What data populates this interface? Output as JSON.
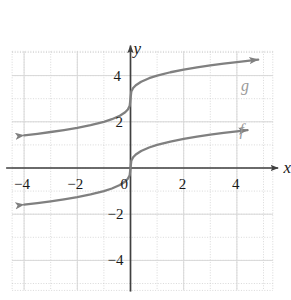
{
  "chart_data": {
    "type": "line",
    "title": "",
    "xlabel": "x",
    "ylabel": "y",
    "xlim": [
      -5.1,
      5.5
    ],
    "ylim": [
      -5.4,
      5.3
    ],
    "grid": true,
    "grid_major_step": 2,
    "grid_minor_step": 1,
    "legend_position": "inline-right",
    "x_ticks": [
      {
        "value": -4,
        "label": "−4"
      },
      {
        "value": -2,
        "label": "−2"
      },
      {
        "value": 0,
        "label": "0"
      },
      {
        "value": 2,
        "label": "2"
      },
      {
        "value": 4,
        "label": "4"
      }
    ],
    "y_ticks": [
      {
        "value": 4,
        "label": "4"
      },
      {
        "value": 2,
        "label": "2"
      },
      {
        "value": -2,
        "label": "−2"
      },
      {
        "value": -4,
        "label": "−4"
      }
    ],
    "series": [
      {
        "name": "f",
        "label": "f",
        "expression": "cube root of x",
        "color": "#808080",
        "arrows": "both",
        "x": [
          -4.0,
          -3.5,
          -3.0,
          -2.5,
          -2.0,
          -1.5,
          -1.0,
          -0.7,
          -0.4,
          -0.2,
          -0.1,
          -0.03,
          0.0,
          0.03,
          0.1,
          0.2,
          0.4,
          0.7,
          1.0,
          1.5,
          2.0,
          2.5,
          3.0,
          3.5,
          4.0,
          4.4
        ],
        "y": [
          -1.587,
          -1.518,
          -1.442,
          -1.357,
          -1.26,
          -1.145,
          -1.0,
          -0.888,
          -0.737,
          -0.585,
          -0.464,
          -0.311,
          0.0,
          0.311,
          0.464,
          0.585,
          0.737,
          0.888,
          1.0,
          1.145,
          1.26,
          1.357,
          1.442,
          1.518,
          1.587,
          1.638
        ]
      },
      {
        "name": "g",
        "label": "g",
        "expression": "cube root of x, shifted up 3",
        "color": "#808080",
        "arrows": "both",
        "x": [
          -4.0,
          -3.5,
          -3.0,
          -2.5,
          -2.0,
          -1.5,
          -1.0,
          -0.7,
          -0.4,
          -0.2,
          -0.1,
          -0.03,
          0.0,
          0.03,
          0.1,
          0.2,
          0.4,
          0.7,
          1.0,
          1.5,
          2.0,
          2.5,
          3.0,
          3.5,
          4.0,
          4.8
        ],
        "y": [
          1.413,
          1.482,
          1.558,
          1.643,
          1.74,
          1.855,
          2.0,
          2.112,
          2.263,
          2.415,
          2.536,
          2.689,
          3.0,
          3.311,
          3.464,
          3.585,
          3.737,
          3.888,
          4.0,
          4.145,
          4.26,
          4.357,
          4.442,
          4.518,
          4.587,
          4.689
        ]
      }
    ],
    "annotations": [
      {
        "text": "g",
        "x": 4.15,
        "y": 3.9
      },
      {
        "text": "f",
        "x": 4.1,
        "y": 2.0
      }
    ]
  },
  "axes": {
    "x_axis_label": "x",
    "y_axis_label": "y"
  },
  "colors": {
    "curve": "#808080",
    "axis": "#404040",
    "grid_major": "#d8d8d8",
    "grid_minor": "#c8c8c8",
    "label": "#1a1a1a",
    "curve_label": "#9a9a9a",
    "background": "#ffffff"
  }
}
